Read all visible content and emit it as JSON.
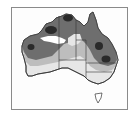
{
  "figure": {
    "type": "shaded contour map",
    "region": "Australia",
    "colors": {
      "frame": "#8a8a8a",
      "background": "#ffffff",
      "zone_highest": "#2a2a2a",
      "zone_high": "#6e6e6e",
      "zone_medium": "#bdbdbd",
      "zone_low": "#e6e6e6",
      "zone_lowest": "#ffffff",
      "borders": "#333333"
    },
    "zones": [
      {
        "level": "highest",
        "shade": "dark",
        "locations": [
          "Kimberley",
          "Top End",
          "Pilbara",
          "Central Queensland",
          "South-east Queensland"
        ]
      },
      {
        "level": "high",
        "shade": "medium-dark gray"
      },
      {
        "level": "medium",
        "shade": "light gray"
      },
      {
        "level": "low",
        "shade": "very light gray"
      },
      {
        "level": "lowest",
        "shade": "white"
      }
    ]
  }
}
